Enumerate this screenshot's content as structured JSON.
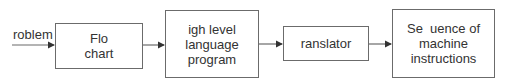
{
  "diagram": {
    "input_label": "roblem",
    "nodes": [
      {
        "id": "flowchart",
        "lines": [
          "Flo",
          "chart"
        ]
      },
      {
        "id": "hll",
        "lines": [
          "igh level",
          "language",
          "program"
        ]
      },
      {
        "id": "translator",
        "lines": [
          "ranslator"
        ]
      },
      {
        "id": "machine",
        "lines": [
          "Se  uence of",
          "machine",
          "instructions"
        ]
      }
    ],
    "colors": {
      "line": "#6b6b6b",
      "text": "#333333"
    }
  }
}
